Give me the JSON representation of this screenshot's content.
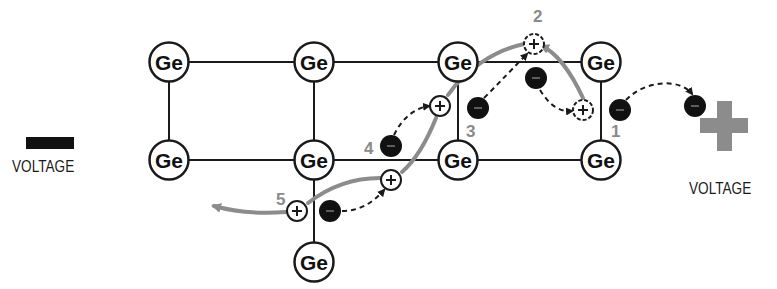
{
  "diagram": {
    "atom_symbol": "Ge",
    "atoms": [
      {
        "x": 169,
        "y": 62
      },
      {
        "x": 314,
        "y": 62
      },
      {
        "x": 458,
        "y": 62
      },
      {
        "x": 601,
        "y": 62
      },
      {
        "x": 169,
        "y": 160
      },
      {
        "x": 314,
        "y": 160
      },
      {
        "x": 458,
        "y": 160
      },
      {
        "x": 601,
        "y": 160
      },
      {
        "x": 314,
        "y": 262
      }
    ],
    "bonds": [
      [
        0,
        1
      ],
      [
        1,
        2
      ],
      [
        2,
        3
      ],
      [
        4,
        5
      ],
      [
        5,
        6
      ],
      [
        6,
        7
      ],
      [
        0,
        4
      ],
      [
        1,
        5
      ],
      [
        2,
        6
      ],
      [
        3,
        7
      ],
      [
        5,
        8
      ]
    ],
    "holes": [
      {
        "id": "h2",
        "x": 534,
        "y": 44
      },
      {
        "id": "h1",
        "x": 583,
        "y": 110
      },
      {
        "id": "h3",
        "x": 440,
        "y": 106
      },
      {
        "id": "h4",
        "x": 391,
        "y": 180
      },
      {
        "id": "h5",
        "x": 297,
        "y": 211
      }
    ],
    "electrons": [
      {
        "id": "e1",
        "x": 620,
        "y": 110
      },
      {
        "id": "e-out",
        "x": 695,
        "y": 106
      },
      {
        "id": "e-mid",
        "x": 536,
        "y": 78
      },
      {
        "id": "e3",
        "x": 478,
        "y": 108
      },
      {
        "id": "e4",
        "x": 391,
        "y": 146
      },
      {
        "id": "e5",
        "x": 330,
        "y": 211
      }
    ],
    "step_labels": [
      {
        "text": "1",
        "x": 611,
        "y": 137
      },
      {
        "text": "2",
        "x": 533,
        "y": 22
      },
      {
        "text": "3",
        "x": 466,
        "y": 137
      },
      {
        "text": "4",
        "x": 364,
        "y": 154
      },
      {
        "text": "5",
        "x": 276,
        "y": 205
      }
    ],
    "colors": {
      "bond": "#1a1a1a",
      "atom_stroke": "#1a1a1a",
      "electron": "#111111",
      "hole_path": "#8c8c8c",
      "electron_path": "#1a1a1a",
      "step_label": "#8a8a8a",
      "positive_terminal": "#8c8c8c",
      "negative_terminal": "#111111"
    }
  },
  "negative_terminal": {
    "symbol": "minus",
    "label": "VOLTAGE"
  },
  "positive_terminal": {
    "symbol": "plus",
    "label": "VOLTAGE"
  }
}
